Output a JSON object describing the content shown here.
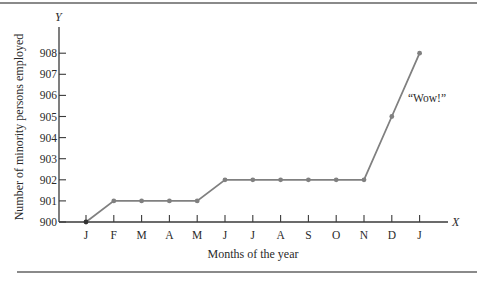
{
  "chart_data": {
    "type": "line",
    "title": "",
    "xlabel": "Months of the year",
    "ylabel": "Number of minority persons employed",
    "x_axis_letter": "X",
    "y_axis_letter": "Y",
    "categories": [
      "J",
      "F",
      "M",
      "A",
      "M",
      "J",
      "J",
      "A",
      "S",
      "O",
      "N",
      "D",
      "J"
    ],
    "series": [
      {
        "name": "Minority persons employed",
        "values": [
          900,
          901,
          901,
          901,
          901,
          902,
          902,
          902,
          902,
          902,
          902,
          905,
          908
        ],
        "color": "#808080"
      }
    ],
    "yticks": [
      900,
      901,
      902,
      903,
      904,
      905,
      906,
      907,
      908
    ],
    "ylim": [
      900,
      908
    ],
    "grid": false,
    "legend": "none",
    "annotations": [
      {
        "text": "“Wow!”",
        "near": "D-J segment"
      }
    ]
  },
  "colors": {
    "line": "#808080",
    "axis": "#3a3a3a",
    "rule": "#8a8a8a"
  }
}
